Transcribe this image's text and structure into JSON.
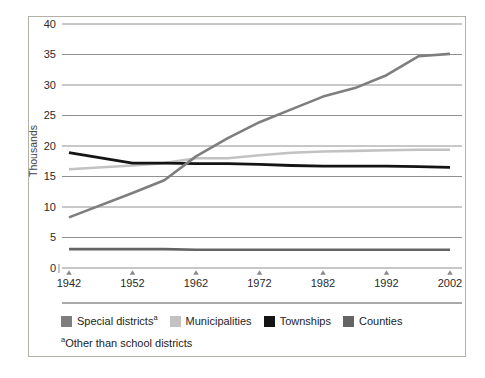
{
  "chart_data": {
    "type": "line",
    "title": "",
    "xlabel": "",
    "ylabel": "Thousands",
    "ylim": [
      0,
      40
    ],
    "xlim": [
      1942,
      2002
    ],
    "y_ticks": [
      0,
      5,
      10,
      15,
      20,
      25,
      30,
      35,
      40
    ],
    "x_ticks": [
      "1942",
      "1952",
      "1962",
      "1972",
      "1982",
      "1992",
      "2002"
    ],
    "x_tick_years": [
      1942,
      1952,
      1962,
      1972,
      1982,
      1992,
      2002
    ],
    "grid": true,
    "legend_position": "bottom",
    "x": [
      1942,
      1952,
      1957,
      1962,
      1967,
      1972,
      1977,
      1982,
      1987,
      1992,
      1997,
      2002
    ],
    "series": [
      {
        "name": "Special districts",
        "superscript": "a",
        "color": "#7e7e7e",
        "values": [
          8.3,
          12.3,
          14.4,
          18.3,
          21.3,
          23.9,
          26.0,
          28.1,
          29.5,
          31.6,
          34.7,
          35.1
        ]
      },
      {
        "name": "Municipalities",
        "superscript": "",
        "color": "#c2c2c2",
        "values": [
          16.2,
          16.8,
          17.2,
          18.0,
          18.0,
          18.5,
          18.9,
          19.1,
          19.2,
          19.3,
          19.4,
          19.4
        ]
      },
      {
        "name": "Townships",
        "superscript": "",
        "color": "#141414",
        "values": [
          18.9,
          17.2,
          17.2,
          17.1,
          17.1,
          17.0,
          16.8,
          16.7,
          16.7,
          16.7,
          16.6,
          16.5
        ]
      },
      {
        "name": "Counties",
        "superscript": "",
        "color": "#646464",
        "values": [
          3.1,
          3.1,
          3.1,
          3.0,
          3.0,
          3.0,
          3.0,
          3.0,
          3.0,
          3.0,
          3.0,
          3.0
        ]
      }
    ]
  },
  "footnote": {
    "marker": "a",
    "text": "Other than school districts"
  },
  "colors": {
    "gridline": "#909090",
    "axis_text": "#2a2a2a",
    "y_axis_title_text": "#444444",
    "frame_border": "#b3b0aa",
    "separator_line": "#555555",
    "tick_marker": "#8a8a8a",
    "background": "#ffffff"
  }
}
